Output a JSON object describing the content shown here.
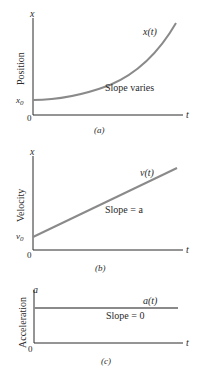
{
  "panels": [
    {
      "id": "a",
      "caption": "(a)",
      "ylabel": "Position",
      "yaxis_var": "x",
      "xaxis_var": "t",
      "origin_label": "0",
      "intercept_label": "x",
      "intercept_sub": "0",
      "curve_label": "x(t)",
      "annotation": "Slope varies"
    },
    {
      "id": "b",
      "caption": "(b)",
      "ylabel": "Velocity",
      "yaxis_var": "x",
      "xaxis_var": "t",
      "origin_label": "0",
      "intercept_label": "v",
      "intercept_sub": "0",
      "curve_label": "v(t)",
      "annotation": "Slope = a"
    },
    {
      "id": "c",
      "caption": "(c)",
      "ylabel": "Acceleration",
      "yaxis_var": "a",
      "xaxis_var": "t",
      "origin_label": "0",
      "curve_label": "a(t)",
      "annotation": "Slope = 0"
    }
  ],
  "colors": {
    "axis": "#2a2a2a",
    "curve": "#8a8a8a",
    "background": "#ffffff"
  }
}
